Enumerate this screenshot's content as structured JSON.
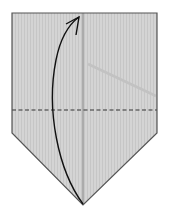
{
  "diagram": {
    "type": "origami-fold-step",
    "colors": {
      "background": "#ffffff",
      "paper_fill": "#d4d4d4",
      "paper_stripe": "#c6c6c6",
      "outline": "#555555",
      "center_crease": "#7a7a7a",
      "valley_fold": "#333333",
      "arrow": "#111111",
      "shadow": "#c2c2c2"
    },
    "shape": {
      "name": "pentagon-house",
      "points": [
        [
          12,
          13
        ],
        [
          157,
          13
        ],
        [
          157,
          133
        ],
        [
          83,
          205
        ],
        [
          12,
          133
        ]
      ]
    },
    "center_crease": {
      "x1": 83,
      "y1": 13,
      "x2": 83,
      "y2": 205
    },
    "valley_fold_line": {
      "x1": 12,
      "y1": 110,
      "x2": 157,
      "y2": 110,
      "style": "dashed"
    },
    "fold_arrow": {
      "path": "M83,204 C58,170 46,110 56,60 C60,40 68,25 79,17",
      "head": "M66,24 L79,17 L76,35"
    },
    "shadow_line": {
      "x1": 88,
      "y1": 64,
      "x2": 156,
      "y2": 96
    }
  }
}
